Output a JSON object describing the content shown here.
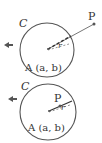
{
  "diagrams": [
    {
      "circle_label": "C",
      "center_label": "A (a, b)",
      "point_label": "P",
      "radius_label": "r",
      "case": "outside"
    },
    {
      "circle_label": "C",
      "center_label": "A (a, b)",
      "point_label": "P",
      "radius_label": "r",
      "case": "inside"
    }
  ],
  "colors": {
    "stroke": "#555555",
    "text": "#333333"
  }
}
